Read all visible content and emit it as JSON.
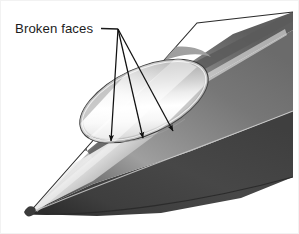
{
  "figure": {
    "type": "technical-illustration",
    "background_color": "#ffffff",
    "width": 299,
    "height": 234
  },
  "annotation": {
    "label": "Broken faces",
    "label_position": {
      "x": 14,
      "y": 31
    },
    "leader_line": {
      "from": {
        "x": 100,
        "y": 27
      },
      "to": {
        "x": 117,
        "y": 28
      },
      "color": "#1a1a1a"
    },
    "converge_point": {
      "x": 117,
      "y": 28
    },
    "arrows": [
      {
        "tip": {
          "x": 110,
          "y": 140
        },
        "name": "arrow-left"
      },
      {
        "tip": {
          "x": 142,
          "y": 137
        },
        "name": "arrow-middle"
      },
      {
        "tip": {
          "x": 172,
          "y": 130
        },
        "name": "arrow-right"
      }
    ],
    "arrow_color": "#111111"
  },
  "shape": {
    "tip": {
      "x": 27,
      "y": 213
    },
    "body_color_light": "#e8e8e8",
    "body_color_mid": "#9a9a9a",
    "body_color_dark": "#4a4a4a",
    "body_color_darkest": "#3a3a3a",
    "rim_color": "#d8d8d8",
    "pocket_highlight": "#fbfbfb",
    "outline_color": "#2e2e2e"
  },
  "pocket": {
    "name": "broken-face-pocket",
    "center": {
      "x": 143,
      "y": 100
    },
    "rx": 69,
    "ry": 33,
    "rotation_deg": -25
  }
}
